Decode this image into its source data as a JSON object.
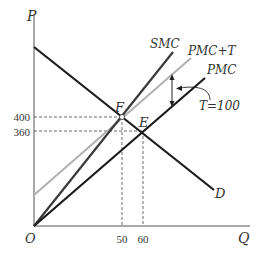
{
  "diagram": {
    "type": "supply-demand-externality",
    "axes": {
      "y_label": "P",
      "x_label": "Q",
      "origin_label": "O"
    },
    "y_ticks": [
      {
        "label": "400",
        "value": 400
      },
      {
        "label": "360",
        "value": 360
      }
    ],
    "x_ticks": [
      {
        "label": "50",
        "value": 50
      },
      {
        "label": "60",
        "value": 60
      }
    ],
    "curves": [
      {
        "name": "SMC",
        "label": "SMC",
        "color": "#3a3a3a"
      },
      {
        "name": "PMC+T",
        "label": "PMC+T",
        "color": "#b0b0b0"
      },
      {
        "name": "PMC",
        "label": "PMC",
        "color": "#1a1a1a"
      },
      {
        "name": "D",
        "label": "D",
        "color": "#1a1a1a"
      }
    ],
    "points": [
      {
        "label": "F",
        "q": 50,
        "p": 400
      },
      {
        "label": "E",
        "q": 60,
        "p": 360
      }
    ],
    "annotation": {
      "label": "T=100"
    }
  }
}
